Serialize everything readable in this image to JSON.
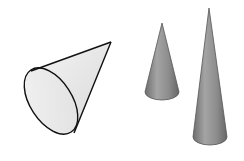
{
  "figure": {
    "shapes": [
      {
        "name": "tilted-cone",
        "fill": "#e8e8e8",
        "stroke": "#111111"
      },
      {
        "name": "short-upright-cone",
        "fill": "#8f8f8f",
        "stroke": "#555555"
      },
      {
        "name": "tall-upright-cone",
        "fill": "#8a8a8a",
        "stroke": "#555555"
      }
    ]
  }
}
